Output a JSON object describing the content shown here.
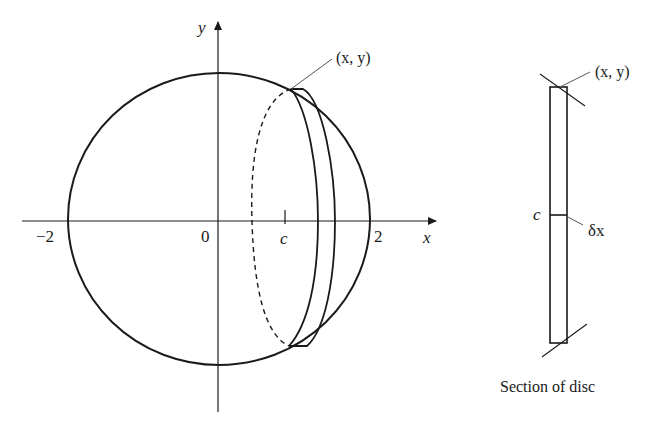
{
  "figure": {
    "type": "diagram",
    "main_plot": {
      "axes": {
        "x_label": "x",
        "y_label": "y",
        "origin_label": "0",
        "x_ticks": [
          {
            "label": "−2",
            "value": -2
          },
          {
            "label": "2",
            "value": 2
          },
          {
            "label": "c",
            "value": "c"
          }
        ]
      },
      "circle": {
        "center": [
          0,
          0
        ],
        "radius": 2
      },
      "point_label": "(x, y)"
    },
    "section": {
      "caption": "Section of disc",
      "point_label": "(x, y)",
      "center_label": "c",
      "thickness_label": "δx"
    }
  },
  "colors": {
    "stroke": "#1a1a1a",
    "leader": "#555555",
    "background": "#ffffff"
  }
}
